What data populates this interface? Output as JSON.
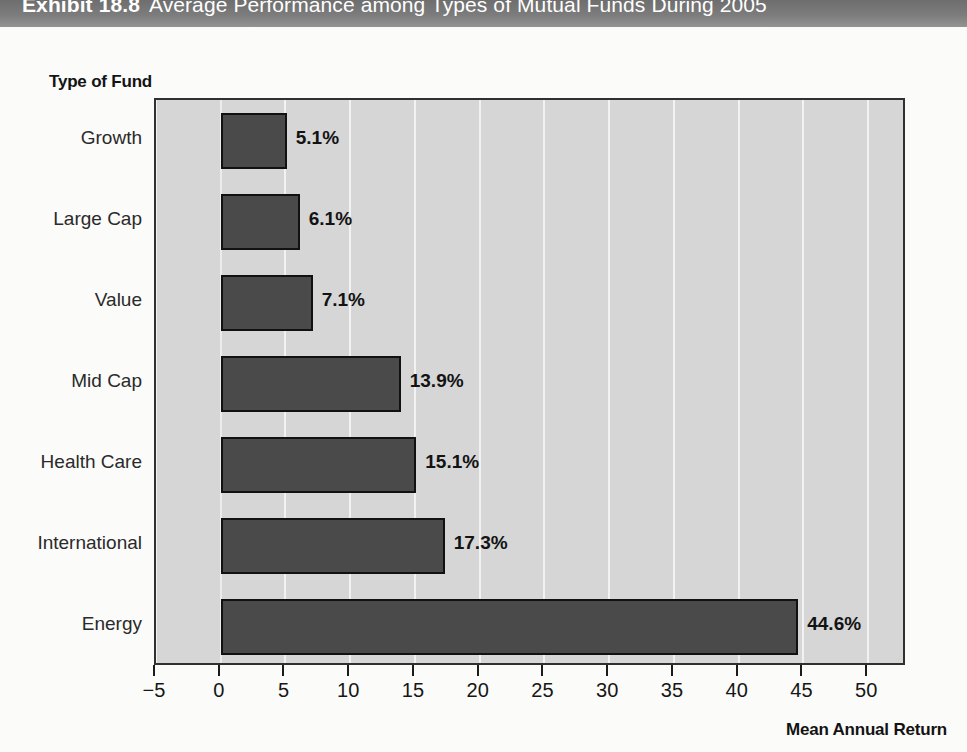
{
  "exhibit": {
    "label": "Exhibit 18.8",
    "title": "Average Performance among Types of Mutual Funds During 2005"
  },
  "colors": {
    "title_band": "#7c7c7c",
    "plot_background": "#d6d6d6",
    "gridline": "#f2f2f2",
    "bar_fill": "#4a4a4a",
    "bar_border": "#111111",
    "axis": "#1b1b1b"
  },
  "chart_data": {
    "type": "bar",
    "orientation": "horizontal",
    "title": "Average Performance among Types of Mutual Funds During 2005",
    "categories": [
      "Growth",
      "Large Cap",
      "Value",
      "Mid Cap",
      "Health Care",
      "International",
      "Energy"
    ],
    "values": [
      5.1,
      6.1,
      7.1,
      13.9,
      15.1,
      17.3,
      44.6
    ],
    "data_labels": [
      "5.1%",
      "6.1%",
      "7.1%",
      "13.9%",
      "15.1%",
      "17.3%",
      "44.6%"
    ],
    "xlabel": "Mean Annual Return",
    "ylabel": "Type of Fund",
    "xlim": [
      -5,
      53
    ],
    "xticks": [
      -5,
      0,
      5,
      10,
      15,
      20,
      25,
      30,
      35,
      40,
      45,
      50
    ],
    "xticklabels": [
      "−5",
      "0",
      "5",
      "10",
      "15",
      "20",
      "25",
      "30",
      "35",
      "40",
      "45",
      "50"
    ],
    "grid": "vertical",
    "legend": "none"
  }
}
